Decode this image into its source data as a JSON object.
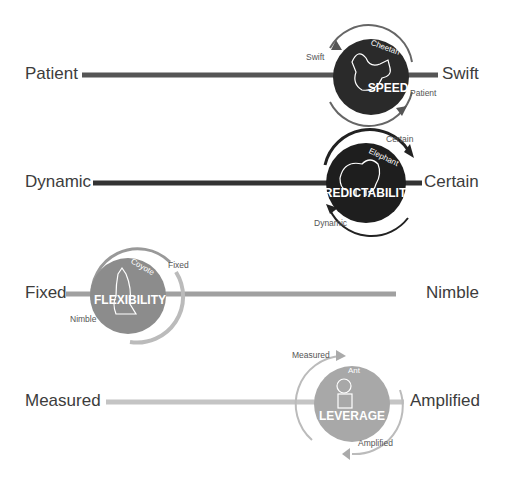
{
  "scales": [
    {
      "id": "speed",
      "left_label": "Patient",
      "right_label": "Swift",
      "circle_word": "SPEED",
      "animal": "Cheetah",
      "arc_label_top": "Swift",
      "arc_label_bottom": "Patient",
      "line_color": "#555555",
      "circle_color": "#2a2a2a",
      "position": "right"
    },
    {
      "id": "predictability",
      "left_label": "Dynamic",
      "right_label": "Certain",
      "circle_word": "PREDICTABILITY",
      "animal": "Elephant",
      "arc_label_top": "Certain",
      "arc_label_bottom": "Dynamic",
      "line_color": "#3a3a3a",
      "circle_color": "#1e1e1e",
      "position": "right"
    },
    {
      "id": "flexibility",
      "left_label": "Fixed",
      "right_label": "Nimble",
      "circle_word": "FLEXIBILITY",
      "animal": "Coyote",
      "arc_label_top": "Fixed",
      "arc_label_bottom": "Nimble",
      "line_color": "#a0a0a0",
      "circle_color": "#8c8c8c",
      "position": "left"
    },
    {
      "id": "leverage",
      "left_label": "Measured",
      "right_label": "Amplified",
      "circle_word": "LEVERAGE",
      "animal": "Ant",
      "arc_label_top": "Measured",
      "arc_label_bottom": "Amplified",
      "line_color": "#c4c4c4",
      "circle_color": "#a8a8a8",
      "position": "right"
    }
  ]
}
